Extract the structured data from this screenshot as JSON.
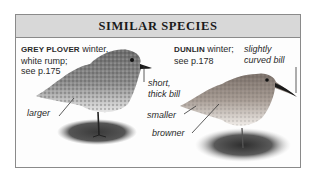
{
  "panel": {
    "title": "SIMILAR SPECIES",
    "colors": {
      "header_bg": "#d8d8d8",
      "border": "#8a8a8a",
      "text": "#2a2a2a"
    }
  },
  "species": [
    {
      "name": "GREY PLOVER",
      "note_line1": " winter,",
      "note_line2": "white rump;",
      "note_line3": "see p.175",
      "annotations": {
        "bill": [
          "short,",
          "thick bill"
        ],
        "size": "larger"
      }
    },
    {
      "name": "DUNLIN",
      "note_line1": " winter;",
      "note_line2": "see p.178",
      "annotations": {
        "bill": [
          "slightly",
          "curved bill"
        ],
        "size": "smaller",
        "color": "browner"
      }
    }
  ]
}
